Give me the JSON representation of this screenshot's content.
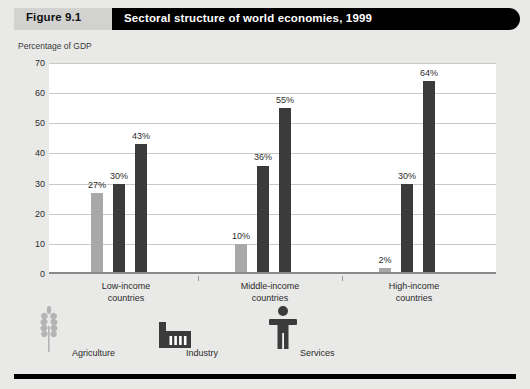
{
  "header": {
    "figure_number": "Figure 9.1",
    "title": "Sectoral structure of world economies, 1999"
  },
  "chart_data": {
    "type": "bar",
    "title": "Sectoral structure of world economies, 1999",
    "xlabel": "",
    "ylabel": "Percentage of GDP",
    "ylim": [
      0,
      70
    ],
    "yticks": [
      70,
      60,
      50,
      40,
      30,
      20,
      10,
      0
    ],
    "grid": true,
    "legend_position": "bottom",
    "categories": [
      "Low-income countries",
      "Middle-income countries",
      "High-income countries"
    ],
    "category_lines": [
      [
        "Low-income",
        "countries"
      ],
      [
        "Middle-income",
        "countries"
      ],
      [
        "High-income",
        "countries"
      ]
    ],
    "series": [
      {
        "name": "Agriculture",
        "icon": "wheat-icon",
        "color": "#a8a8a8",
        "values": [
          27,
          10,
          2
        ],
        "labels": [
          "27%",
          "10%",
          "2%"
        ]
      },
      {
        "name": "Industry",
        "icon": "factory-icon",
        "color": "#3b3b3b",
        "values": [
          30,
          36,
          30
        ],
        "labels": [
          "30%",
          "36%",
          "30%"
        ]
      },
      {
        "name": "Services",
        "icon": "person-icon",
        "color": "#3b3b3b",
        "values": [
          43,
          55,
          64
        ],
        "labels": [
          "43%",
          "55%",
          "64%"
        ]
      }
    ]
  },
  "legend": {
    "items": [
      {
        "label": "Agriculture",
        "icon": "wheat-icon"
      },
      {
        "label": "Industry",
        "icon": "factory-icon"
      },
      {
        "label": "Services",
        "icon": "person-icon"
      }
    ]
  },
  "colors": {
    "page_background": "#e9e9e7",
    "plot_background": "#ffffff",
    "agriculture": "#a8a8a8",
    "industry": "#3b3b3b",
    "services": "#3b3b3b",
    "title_bar": "#000000",
    "figure_number_box": "#d2d2d0",
    "gridline": "#c8c8c8"
  }
}
